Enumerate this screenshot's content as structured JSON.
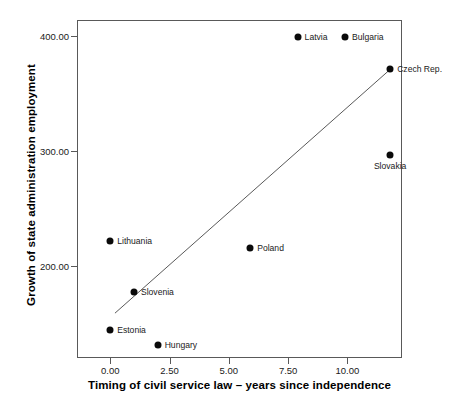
{
  "chart_data": {
    "type": "scatter",
    "title": "",
    "xlabel": "Timing of civil service law – years since independence",
    "ylabel": "Growth of state administration employment",
    "xlim": [
      -1.4,
      12.3
    ],
    "ylim": [
      120.0,
      414.0
    ],
    "grid": false,
    "legend": false,
    "xticks": [
      0.0,
      2.5,
      5.0,
      7.5,
      10.0
    ],
    "xtick_labels": [
      "0.00",
      "2.50",
      "5.00",
      "7.50",
      "10.00"
    ],
    "yticks": [
      200.0,
      300.0,
      400.0
    ],
    "ytick_labels": [
      "200.00",
      "300.00",
      "400.00"
    ],
    "point_color": "#0a0a0a",
    "line_color": "#595959",
    "axis_color": "#595959",
    "points": [
      {
        "label": "Latvia",
        "x": 7.9,
        "y": 399,
        "label_pos": "right"
      },
      {
        "label": "Bulgaria",
        "x": 9.9,
        "y": 399,
        "label_pos": "right"
      },
      {
        "label": "Czech Rep.",
        "x": 11.8,
        "y": 371,
        "label_pos": "right"
      },
      {
        "label": "Slovakia",
        "x": 11.8,
        "y": 297,
        "label_pos": "below"
      },
      {
        "label": "Poland",
        "x": 5.9,
        "y": 216,
        "label_pos": "right"
      },
      {
        "label": "Lithuania",
        "x": 0.0,
        "y": 222,
        "label_pos": "right"
      },
      {
        "label": "Slovenia",
        "x": 1.0,
        "y": 177,
        "label_pos": "right"
      },
      {
        "label": "Estonia",
        "x": 0.0,
        "y": 144,
        "label_pos": "right"
      },
      {
        "label": "Hungary",
        "x": 2.0,
        "y": 131,
        "label_pos": "right"
      }
    ],
    "fit_line": {
      "name": "linear fit",
      "x_start": 0.2,
      "y_start": 159,
      "x_end": 11.8,
      "y_end": 371
    }
  }
}
